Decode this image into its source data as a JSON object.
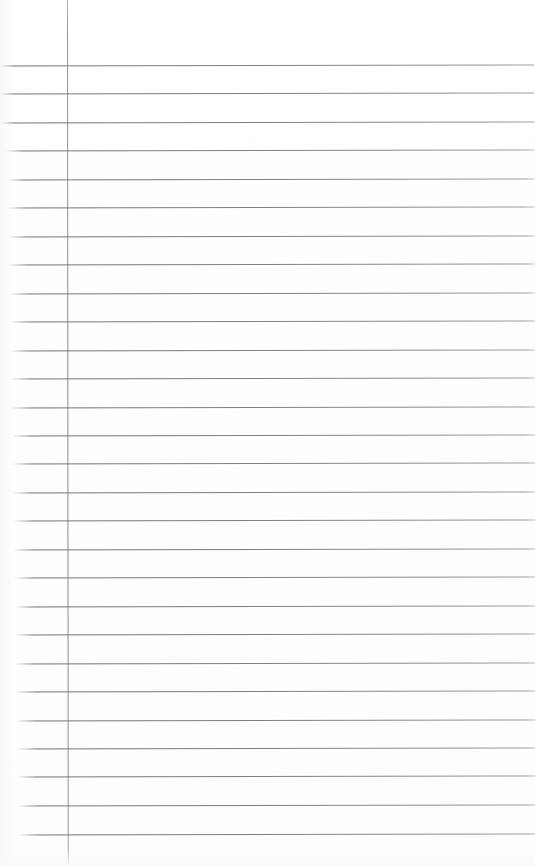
{
  "document": {
    "kind": "lined-notebook-paper",
    "title": "Blank ruled notebook page",
    "width_px": 535,
    "height_px": 866,
    "background_color": "#ffffff",
    "content_text": "",
    "has_handwriting": false
  },
  "paper": {
    "rule_color": "#6c6c74",
    "rule_thickness_px": 1,
    "margin_rule_color": "#7e7e86",
    "margin_rule_x_px": 67,
    "margin_rule_top_px": 0,
    "margin_rule_height_px": 866,
    "first_rule_y_px": 65,
    "rule_spacing_px": 28.3,
    "rule_count": 28,
    "skew_degrees": -0.12,
    "rules": [
      {
        "y": 65,
        "left": 0,
        "right": 535,
        "flush": true
      },
      {
        "y": 93,
        "left": 0,
        "right": 535,
        "flush": true
      },
      {
        "y": 122,
        "left": 2,
        "right": 535,
        "flush": true
      },
      {
        "y": 150,
        "left": 4,
        "right": 535,
        "flush": false
      },
      {
        "y": 179,
        "left": 6,
        "right": 535,
        "flush": false
      },
      {
        "y": 207,
        "left": 7,
        "right": 535,
        "flush": false
      },
      {
        "y": 236,
        "left": 8,
        "right": 535,
        "flush": false
      },
      {
        "y": 264,
        "left": 8,
        "right": 535,
        "flush": false
      },
      {
        "y": 293,
        "left": 9,
        "right": 535,
        "flush": false
      },
      {
        "y": 321,
        "left": 10,
        "right": 535,
        "flush": false
      },
      {
        "y": 350,
        "left": 10,
        "right": 535,
        "flush": false
      },
      {
        "y": 378,
        "left": 11,
        "right": 535,
        "flush": false
      },
      {
        "y": 407,
        "left": 11,
        "right": 535,
        "flush": false
      },
      {
        "y": 435,
        "left": 12,
        "right": 535,
        "flush": false
      },
      {
        "y": 463,
        "left": 12,
        "right": 535,
        "flush": false
      },
      {
        "y": 492,
        "left": 12,
        "right": 535,
        "flush": false
      },
      {
        "y": 520,
        "left": 13,
        "right": 535,
        "flush": false
      },
      {
        "y": 549,
        "left": 13,
        "right": 535,
        "flush": false
      },
      {
        "y": 577,
        "left": 13,
        "right": 535,
        "flush": false
      },
      {
        "y": 606,
        "left": 14,
        "right": 535,
        "flush": false
      },
      {
        "y": 634,
        "left": 14,
        "right": 535,
        "flush": false
      },
      {
        "y": 663,
        "left": 14,
        "right": 535,
        "flush": false
      },
      {
        "y": 691,
        "left": 15,
        "right": 535,
        "flush": false
      },
      {
        "y": 720,
        "left": 15,
        "right": 535,
        "flush": false
      },
      {
        "y": 748,
        "left": 16,
        "right": 535,
        "flush": false
      },
      {
        "y": 776,
        "left": 16,
        "right": 535,
        "flush": false
      },
      {
        "y": 805,
        "left": 17,
        "right": 535,
        "flush": false
      },
      {
        "y": 834,
        "left": 18,
        "right": 535,
        "flush": false
      }
    ]
  }
}
